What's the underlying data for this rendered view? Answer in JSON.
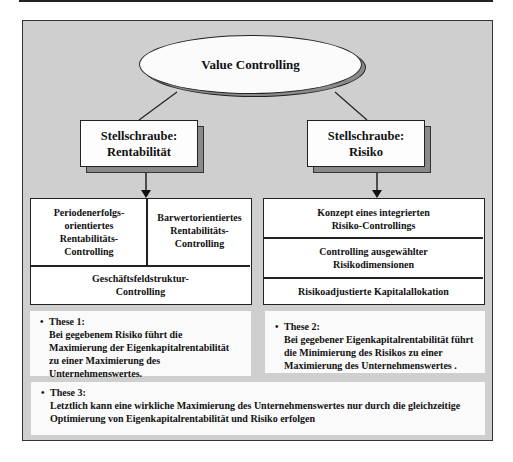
{
  "diagram": {
    "root": {
      "label": "Value Controlling"
    },
    "levers": [
      {
        "line1": "Stellschraube:",
        "line2": "Rentabilität"
      },
      {
        "line1": "Stellschraube:",
        "line2": "Risiko"
      }
    ],
    "rentability_table": {
      "top_left": "Periodenerfolgs-\norientiertes\nRentabilitäts-\nControlling",
      "top_right": "Barwertorientiertes\nRentabilitäts-\nControlling",
      "bottom": "Geschäftsfeldstruktur-\nControlling"
    },
    "risk_table": {
      "rows": [
        "Konzept eines integrierten\nRisiko-Controllings",
        "Controlling ausgewählter\nRisikodimensionen",
        "Risikoadjustierte Kapitalallokation"
      ]
    },
    "theses": [
      {
        "bullet": "•",
        "title": "These 1:",
        "body": "Bei gegebenem Risiko führt die\nMaximierung der Eigenkapitalrentabilität\nzu einer Maximierung des\nUnternehmenswertes."
      },
      {
        "bullet": "•",
        "title": "These 2:",
        "body": "Bei gegebener Eigenkapitalrentabilität führt\ndie Minimierung des Risikos zu einer\nMaximierung des Unternehmenswertes ."
      },
      {
        "bullet": "•",
        "title": "These 3:",
        "body": "Letztlich kann eine wirkliche Maximierung des Unternehmenswertes nur durch die gleichzeitige\nOptimierung von Eigenkapitalrentabilität und Risiko erfolgen"
      }
    ]
  },
  "colors": {
    "frame_background": "#cfcfcf",
    "shadow": "#8a8a8a",
    "box_fill": "#ffffff",
    "stroke": "#222222"
  }
}
